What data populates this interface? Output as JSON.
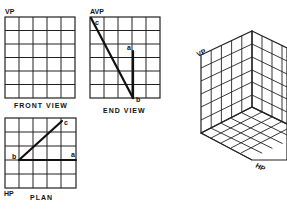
{
  "diagram": {
    "type": "orthographic-projection",
    "front_view": {
      "plane_label": "VP",
      "caption": "FRONT VIEW",
      "grid": {
        "cols": 5,
        "rows": 6
      }
    },
    "end_view": {
      "plane_label": "AVP",
      "caption": "END VIEW",
      "grid": {
        "cols": 5,
        "rows": 6
      },
      "points": {
        "a": "a",
        "b": "b",
        "c": "c"
      }
    },
    "plan": {
      "plane_label": "HP",
      "caption": "PLAN",
      "grid": {
        "cols": 5,
        "rows": 5
      },
      "points": {
        "a": "a",
        "b": "b",
        "c": "c"
      }
    },
    "isometric": {
      "vp_label": "VP",
      "hp_label": "HP",
      "grid": {
        "cols": 5,
        "rows": 6
      }
    }
  }
}
